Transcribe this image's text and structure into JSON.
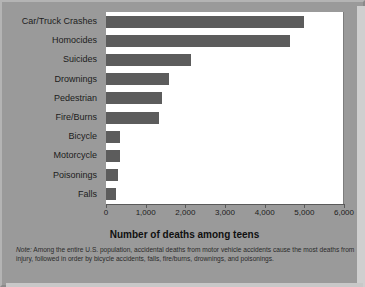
{
  "chart_data": {
    "type": "bar",
    "orientation": "horizontal",
    "title": "",
    "xlabel": "Number of deaths among teens",
    "ylabel": "",
    "xlim": [
      0,
      6000
    ],
    "xticks": [
      0,
      1000,
      2000,
      3000,
      4000,
      5000,
      6000
    ],
    "xtick_labels": [
      "0",
      "1,000",
      "2,000",
      "3,000",
      "4,000",
      "5,000",
      "6,000"
    ],
    "grid": false,
    "legend": "none",
    "bar_color": "#5c5c5c",
    "plot_background": "#ffffff",
    "figure_background": "#9a9a9a",
    "categories": [
      "Car/Truck Crashes",
      "Homocides",
      "Suicides",
      "Drownings",
      "Pedestrian",
      "Fire/Burns",
      "Bicycle",
      "Motorcycle",
      "Poisonings",
      "Falls"
    ],
    "values": [
      5000,
      4650,
      2150,
      1600,
      1420,
      1330,
      350,
      350,
      300,
      260
    ],
    "note": "Among the entire U.S. population, accidental deaths from motor vehicle accidents cause the most deaths from injury, followed in order by bicycle accidents, falls, fire/burns, drownings, and poisonings.",
    "note_prefix": "Note:"
  }
}
